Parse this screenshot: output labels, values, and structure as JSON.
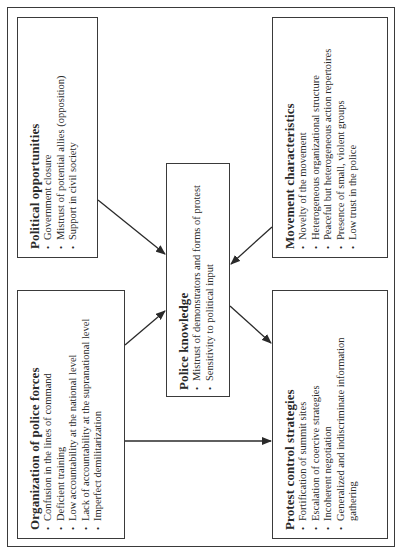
{
  "diagram": {
    "orientation": "rotated-90-ccw",
    "boxes": {
      "political": {
        "title": "Political opportunities",
        "items": [
          "Government closure",
          "Mistrust of potential allies (opposition)",
          "Support in civil society"
        ]
      },
      "movement": {
        "title": "Movement characteristics",
        "items": [
          "Novelty of the movement",
          "Heterogeneous organizational structure",
          "Peaceful but heterogeneous action repertoires",
          "Presence of small, violent groups",
          "Low trust in the police"
        ]
      },
      "knowledge": {
        "title": "Police knowledge",
        "items": [
          "Mistrust of demonstrators and forms of protest",
          "Sensitivity to political input"
        ]
      },
      "organization": {
        "title": "Organization of police forces",
        "items": [
          "Confusion in the lines of command",
          "Deficient training",
          "Low accountability at the national level",
          "Lack of accountability at the supranational level",
          "Imperfect demilitarization"
        ]
      },
      "strategies": {
        "title": "Protest control strategies",
        "items": [
          "Fortification of summit sites",
          "Escalation of coercive strategies",
          "Incoherent negotiation",
          "Generalized and indiscriminate information",
          "gathering"
        ]
      }
    },
    "arrows": [
      {
        "from": "Political opportunities",
        "to": "Police knowledge"
      },
      {
        "from": "Movement characteristics",
        "to": "Police knowledge"
      },
      {
        "from": "Organization of police forces",
        "to": "Police knowledge"
      },
      {
        "from": "Organization of police forces",
        "to": "Protest control strategies"
      },
      {
        "from": "Police knowledge",
        "to": "Protest control strategies"
      }
    ],
    "colors": {
      "line": "#3a3a3a",
      "text": "#2a2a2a",
      "background": "#ffffff"
    }
  }
}
